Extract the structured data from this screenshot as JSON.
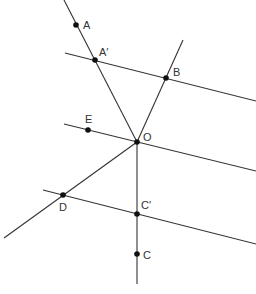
{
  "diagram": {
    "type": "geometric-construction",
    "colors": {
      "line": "#333333",
      "point": "#111111",
      "background": "#ffffff"
    },
    "points": [
      {
        "id": "A",
        "label": "A",
        "x": 76,
        "y": 25,
        "lx": 83,
        "ly": 29
      },
      {
        "id": "A1",
        "label": "A′",
        "x": 95,
        "y": 60,
        "lx": 99,
        "ly": 56
      },
      {
        "id": "B",
        "label": "B",
        "x": 166,
        "y": 78,
        "lx": 173,
        "ly": 76
      },
      {
        "id": "E",
        "label": "E",
        "x": 88,
        "y": 130,
        "lx": 85,
        "ly": 123
      },
      {
        "id": "O",
        "label": "O",
        "x": 137,
        "y": 142,
        "lx": 143,
        "ly": 141
      },
      {
        "id": "D",
        "label": "D",
        "x": 63,
        "y": 195,
        "lx": 59,
        "ly": 211
      },
      {
        "id": "C1",
        "label": "C′",
        "x": 137,
        "y": 214,
        "lx": 141,
        "ly": 209
      },
      {
        "id": "C",
        "label": "C",
        "x": 137,
        "y": 254,
        "lx": 143,
        "ly": 259
      }
    ],
    "lines": [
      {
        "id": "line-AO",
        "x1": 64,
        "y1": 0,
        "x2": 137,
        "y2": 142
      },
      {
        "id": "line-A1B",
        "x1": 65,
        "y1": 53,
        "x2": 256,
        "y2": 101
      },
      {
        "id": "line-OB",
        "x1": 137,
        "y1": 142,
        "x2": 183,
        "y2": 40
      },
      {
        "id": "line-EO",
        "x1": 64,
        "y1": 124,
        "x2": 256,
        "y2": 171
      },
      {
        "id": "line-OD",
        "x1": 137,
        "y1": 142,
        "x2": 4,
        "y2": 238
      },
      {
        "id": "line-DC1",
        "x1": 43,
        "y1": 190,
        "x2": 256,
        "y2": 244
      },
      {
        "id": "line-OC",
        "x1": 137,
        "y1": 142,
        "x2": 137,
        "y2": 284
      }
    ]
  }
}
